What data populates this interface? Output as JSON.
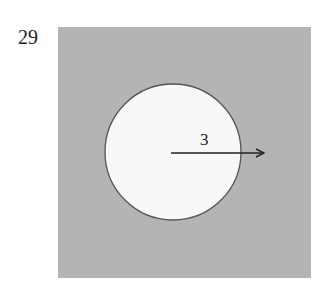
{
  "problem": {
    "number": "29"
  },
  "figure": {
    "square": {
      "x": 58,
      "y": 27,
      "width": 253,
      "height": 251,
      "fill": "#b4b4b4"
    },
    "circle": {
      "cx": 173,
      "cy": 152,
      "r": 68,
      "fill": "#f8f8f8",
      "stroke": "#555555"
    },
    "radius": {
      "label": "3",
      "x1": 171,
      "y1": 153,
      "x2": 264,
      "y2": 153
    }
  }
}
